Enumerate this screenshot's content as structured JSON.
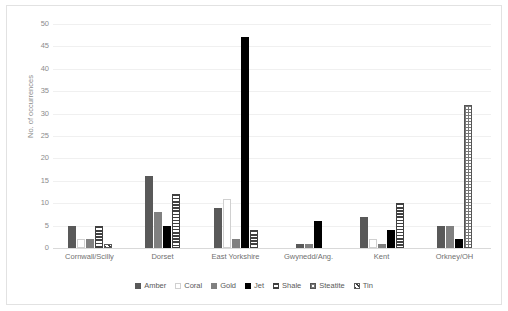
{
  "chart_data": {
    "type": "bar",
    "title": "",
    "xlabel": "",
    "ylabel": "No. of occurrences",
    "ylim": [
      0,
      50
    ],
    "yticks": [
      50,
      45,
      40,
      35,
      30,
      25,
      20,
      15,
      10,
      5,
      0
    ],
    "grid": true,
    "legend_position": "bottom",
    "categories": [
      "Cornwall/Scilly",
      "Dorset",
      "East Yorkshire",
      "Gwynedd/Ang.",
      "Kent",
      "Orkney/OH"
    ],
    "series": [
      {
        "name": "Amber",
        "color": "#595959",
        "pattern": "solid",
        "values": [
          5,
          16,
          9,
          1,
          7,
          5
        ]
      },
      {
        "name": "Coral",
        "color": "#ffffff",
        "pattern": "outline",
        "values": [
          2,
          0,
          11,
          0,
          2,
          0
        ]
      },
      {
        "name": "Gold",
        "color": "#808080",
        "pattern": "solid",
        "values": [
          2,
          8,
          2,
          1,
          1,
          5
        ]
      },
      {
        "name": "Jet",
        "color": "#000000",
        "pattern": "solid",
        "values": [
          0,
          5,
          47,
          6,
          4,
          2
        ]
      },
      {
        "name": "Shale",
        "color": "#404040",
        "pattern": "horizontal",
        "values": [
          5,
          12,
          4,
          0,
          10,
          0
        ]
      },
      {
        "name": "Steatite",
        "color": "#555555",
        "pattern": "dotted",
        "values": [
          0,
          0,
          0,
          0,
          0,
          32
        ]
      },
      {
        "name": "Tin",
        "color": "#3d3d3d",
        "pattern": "diagonal",
        "values": [
          1,
          0,
          0,
          0,
          0,
          0
        ]
      }
    ]
  }
}
